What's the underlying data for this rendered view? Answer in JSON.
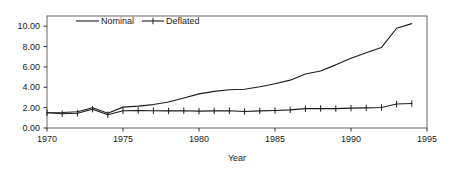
{
  "chart_data": {
    "type": "line",
    "title": "",
    "xlabel": "Year",
    "ylabel": "",
    "xlim": [
      1970,
      1995
    ],
    "ylim": [
      0.0,
      11.0
    ],
    "xticks": [
      1970,
      1975,
      1980,
      1985,
      1990,
      1995
    ],
    "xtick_labels": [
      "1970",
      "1975",
      "1980",
      "1985",
      "1990",
      "1995"
    ],
    "yticks": [
      0.0,
      2.0,
      4.0,
      6.0,
      8.0,
      10.0
    ],
    "ytick_labels": [
      "0.00",
      "2.00",
      "4.00",
      "6.00",
      "8.00",
      "10.00"
    ],
    "grid": false,
    "legend_position": "top-center",
    "x": [
      1970,
      1971,
      1972,
      1973,
      1974,
      1975,
      1976,
      1977,
      1978,
      1979,
      1980,
      1981,
      1982,
      1983,
      1984,
      1985,
      1986,
      1987,
      1988,
      1989,
      1990,
      1991,
      1992,
      1993,
      1994
    ],
    "series": [
      {
        "name": "Nominal",
        "marker": "none",
        "color": "#1a1a1a",
        "values": [
          1.5,
          1.52,
          1.6,
          1.98,
          1.45,
          2.05,
          2.15,
          2.3,
          2.55,
          2.95,
          3.35,
          3.6,
          3.75,
          3.8,
          4.05,
          4.35,
          4.7,
          5.3,
          5.6,
          6.2,
          6.85,
          7.4,
          7.9,
          9.8,
          10.25
        ]
      },
      {
        "name": "Deflated",
        "marker": "plus",
        "color": "#1a1a1a",
        "values": [
          1.5,
          1.4,
          1.45,
          1.85,
          1.3,
          1.7,
          1.72,
          1.7,
          1.68,
          1.7,
          1.66,
          1.68,
          1.7,
          1.62,
          1.68,
          1.72,
          1.78,
          1.9,
          1.92,
          1.9,
          1.95,
          1.98,
          2.02,
          2.35,
          2.4
        ]
      }
    ]
  },
  "legend": {
    "entries": [
      {
        "label": "Nominal",
        "marker": "line"
      },
      {
        "label": "Deflated",
        "marker": "line-plus"
      }
    ]
  }
}
